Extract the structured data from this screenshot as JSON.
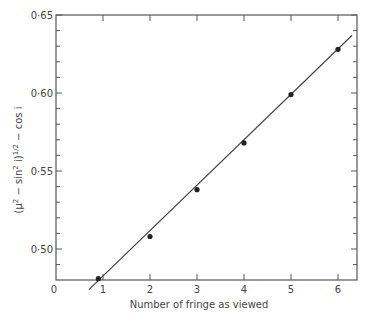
{
  "chart_data": {
    "type": "scatter",
    "title": "",
    "xlabel": "Number of fringe as viewed",
    "ylabel": "(μ² − sin² i)¹ᐟ² − cos i",
    "ylabel_parts": {
      "open": "(",
      "mu": "μ",
      "sup2a": "2",
      "minus_sin": " − sin",
      "sup2b": "2",
      "i_close": " i)",
      "sup_half": "1/2",
      "tail": " − cos i"
    },
    "x_ticks": [
      "0",
      "1",
      "2",
      "3",
      "4",
      "5",
      "6"
    ],
    "y_ticks": [
      "0·50",
      "0·55",
      "0·60",
      "0·65"
    ],
    "xlim": [
      0,
      6.4
    ],
    "ylim": [
      0.48,
      0.65
    ],
    "grid": false,
    "legend": null,
    "series": [
      {
        "name": "measured",
        "marker": "dot",
        "x": [
          0.9,
          2,
          3,
          4,
          5,
          6
        ],
        "y": [
          0.481,
          0.508,
          0.538,
          0.568,
          0.599,
          0.628
        ]
      }
    ],
    "fit_line": {
      "x": [
        0.7,
        6.3
      ],
      "y": [
        0.474,
        0.637
      ]
    }
  }
}
